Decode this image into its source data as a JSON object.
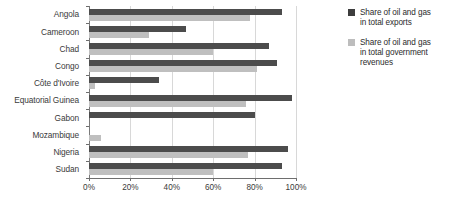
{
  "chart_data": {
    "type": "bar",
    "orientation": "horizontal",
    "title": "",
    "xlabel": "",
    "ylabel": "",
    "xlim": [
      0,
      100
    ],
    "xticks": [
      0,
      20,
      40,
      60,
      80,
      100
    ],
    "xtick_labels": [
      "0%",
      "20%",
      "40%",
      "60%",
      "80%",
      "100%"
    ],
    "grid": true,
    "grid_axis": "x",
    "legend_position": "right",
    "categories": [
      "Angola",
      "Cameroon",
      "Chad",
      "Congo",
      "Côte d'Ivoire",
      "Equatorial Guinea",
      "Gabon",
      "Mozambique",
      "Nigeria",
      "Sudan"
    ],
    "series": [
      {
        "name": "Share of oil and gas in total exports",
        "color": "#4c4c4c",
        "values": [
          93,
          47,
          87,
          91,
          34,
          98,
          80,
          0,
          96,
          93
        ]
      },
      {
        "name": "Share of oil and gas in total government revenues",
        "color": "#bfbfbf",
        "values": [
          78,
          29,
          60,
          81,
          3,
          76,
          0,
          6,
          77,
          60
        ]
      }
    ]
  },
  "legend": {
    "items": [
      {
        "swatch": "exports",
        "line1": "Share of oil and gas",
        "line2": "in total exports",
        "line3": ""
      },
      {
        "swatch": "revenues",
        "line1": "Share of oil and gas",
        "line2": "in total government",
        "line3": "revenues"
      }
    ]
  },
  "colors": {
    "exports": "#4c4c4c",
    "revenues": "#bfbfbf",
    "axis": "#6e6e6e",
    "gridline": "#d8d8d8",
    "text": "#3a3a3a",
    "background": "#ffffff"
  }
}
